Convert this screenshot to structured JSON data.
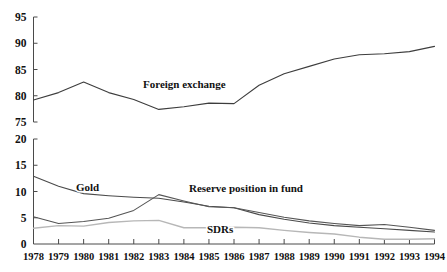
{
  "chart_data": {
    "type": "line",
    "title": "",
    "subtitle": "",
    "xlabel": "",
    "ylabel": "",
    "grid": false,
    "legend_position": "inline-annotations",
    "x": [
      1978,
      1979,
      1980,
      1981,
      1982,
      1983,
      1984,
      1985,
      1986,
      1987,
      1988,
      1989,
      1990,
      1991,
      1992,
      1993,
      1994
    ],
    "x_tick_labels": [
      "1978",
      "1979",
      "1980",
      "1981",
      "1982",
      "1983",
      "1984",
      "1985",
      "1986",
      "1987",
      "1988",
      "1989",
      "1990",
      "1991",
      "1992",
      "1993",
      "1994"
    ],
    "panels": [
      {
        "name": "upper",
        "ylim": [
          75,
          95
        ],
        "y_tick_labels": [
          "95",
          "90",
          "85",
          "80",
          "75"
        ],
        "y_ticks": [
          95,
          90,
          85,
          80,
          75
        ]
      },
      {
        "name": "lower",
        "ylim": [
          0,
          20
        ],
        "y_tick_labels": [
          "20",
          "15",
          "10",
          "5",
          "0"
        ],
        "y_ticks": [
          20,
          15,
          10,
          5,
          0
        ]
      }
    ],
    "series": [
      {
        "name": "Foreign exchange",
        "panel": "upper",
        "color": "#3d3d3d",
        "width": 1.1,
        "values": [
          79.2,
          80.6,
          82.6,
          80.6,
          79.3,
          77.4,
          77.9,
          78.6,
          78.5,
          82.0,
          84.2,
          85.6,
          87.0,
          87.8,
          88.0,
          88.4,
          89.4
        ]
      },
      {
        "name": "Gold",
        "panel": "lower",
        "color": "#4a4a4a",
        "width": 1.1,
        "values": [
          12.9,
          11.0,
          9.6,
          9.2,
          8.9,
          8.7,
          8.0,
          7.2,
          6.9,
          5.6,
          4.7,
          4.0,
          3.5,
          3.2,
          2.9,
          2.6,
          2.3
        ]
      },
      {
        "name": "Reserve position in fund",
        "panel": "lower",
        "color": "#555555",
        "width": 1.1,
        "values": [
          5.2,
          3.9,
          4.3,
          4.9,
          6.4,
          9.4,
          8.2,
          7.1,
          6.9,
          6.0,
          5.1,
          4.4,
          3.9,
          3.5,
          3.7,
          3.2,
          2.6
        ]
      },
      {
        "name": "SDRs",
        "panel": "lower",
        "color": "#b7b7b7",
        "width": 1.4,
        "values": [
          3.0,
          3.5,
          3.4,
          4.1,
          4.4,
          4.5,
          3.1,
          3.1,
          3.2,
          3.1,
          2.6,
          2.2,
          1.9,
          1.3,
          0.9,
          0.9,
          1.0
        ]
      }
    ],
    "annotations": [
      {
        "text": "Foreign exchange",
        "x": 143,
        "y": 88
      },
      {
        "text": "Gold",
        "x": 76,
        "y": 191
      },
      {
        "text": "Reserve position in fund",
        "x": 189,
        "y": 192
      },
      {
        "text": "SDRs",
        "x": 207,
        "y": 233
      }
    ]
  }
}
